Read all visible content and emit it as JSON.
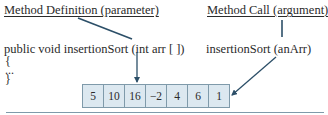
{
  "left": {
    "heading": "Method Definition (parameter)",
    "signature": "public void insertionSort (int arr [ ])",
    "open_brace": "{",
    "ellipsis": "...",
    "close_brace": "}"
  },
  "right": {
    "heading": "Method Call (argument)",
    "call": "insertionSort (anArr)"
  },
  "array": {
    "cells": [
      "5",
      "10",
      "16",
      "−2",
      "4",
      "6",
      "1"
    ]
  },
  "colors": {
    "arrow": "#2c4f68",
    "cell_fill": "#dce8f0",
    "cell_border": "#7f9aaa"
  }
}
